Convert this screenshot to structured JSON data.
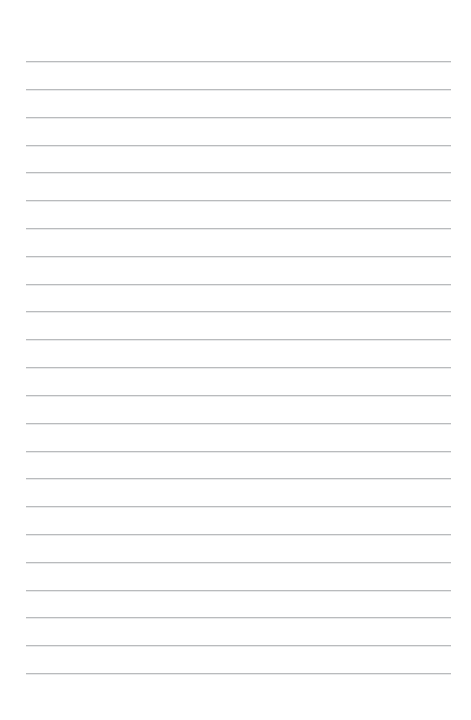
{
  "document": {
    "kind": "lined-paper",
    "title": "Blank Lined Paper",
    "description": "A blank sheet of ruled writing paper with evenly spaced horizontal lines.",
    "text_content": "",
    "page_number": "",
    "header_text": "",
    "footer_text": ""
  },
  "canvas": {
    "width": 471,
    "height": 720,
    "background_color": "#ffffff"
  },
  "ruling": {
    "line_color": "#b9bbbd",
    "line_thickness_px": 1,
    "line_count": 23,
    "first_line_y": 61,
    "line_spacing_px": 27.8,
    "left_x": 26,
    "right_x": 451,
    "line_length_px": 425,
    "top_margin_px": 61,
    "bottom_margin_px": 47,
    "left_margin_px": 26,
    "right_margin_px": 20,
    "has_vertical_margin_rule": false,
    "has_holes": false,
    "lines": [
      {
        "index": 1,
        "y": 61,
        "label": "line-1"
      },
      {
        "index": 2,
        "y": 88.8,
        "label": "line-2"
      },
      {
        "index": 3,
        "y": 116.6,
        "label": "line-3"
      },
      {
        "index": 4,
        "y": 144.5,
        "label": "line-4"
      },
      {
        "index": 5,
        "y": 172.3,
        "label": "line-5"
      },
      {
        "index": 6,
        "y": 200.1,
        "label": "line-6"
      },
      {
        "index": 7,
        "y": 227.9,
        "label": "line-7"
      },
      {
        "index": 8,
        "y": 255.7,
        "label": "line-8"
      },
      {
        "index": 9,
        "y": 283.5,
        "label": "line-9"
      },
      {
        "index": 10,
        "y": 311.4,
        "label": "line-10"
      },
      {
        "index": 11,
        "y": 339.2,
        "label": "line-11"
      },
      {
        "index": 12,
        "y": 367.0,
        "label": "line-12"
      },
      {
        "index": 13,
        "y": 394.8,
        "label": "line-13"
      },
      {
        "index": 14,
        "y": 422.6,
        "label": "line-14"
      },
      {
        "index": 15,
        "y": 450.5,
        "label": "line-15"
      },
      {
        "index": 16,
        "y": 478.3,
        "label": "line-16"
      },
      {
        "index": 17,
        "y": 506.1,
        "label": "line-17"
      },
      {
        "index": 18,
        "y": 533.9,
        "label": "line-18"
      },
      {
        "index": 19,
        "y": 561.7,
        "label": "line-19"
      },
      {
        "index": 20,
        "y": 589.5,
        "label": "line-20"
      },
      {
        "index": 21,
        "y": 617.4,
        "label": "line-21"
      },
      {
        "index": 22,
        "y": 645.2,
        "label": "line-22"
      },
      {
        "index": 23,
        "y": 673.0,
        "label": "line-23"
      }
    ]
  }
}
